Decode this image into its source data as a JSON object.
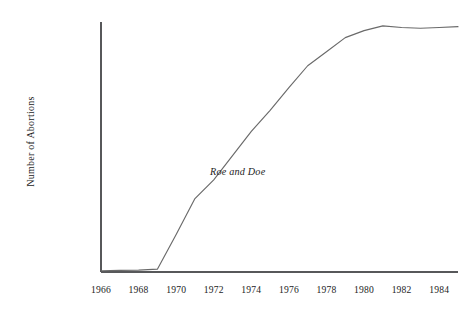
{
  "chart_data": {
    "type": "line",
    "title": "",
    "xlabel": "",
    "ylabel": "Number of Abortions",
    "xlim": [
      1966,
      1985
    ],
    "ylim": [
      0,
      1600000
    ],
    "grid": false,
    "legend": "none",
    "x_tick_labels": [
      "1966",
      "1968",
      "1970",
      "1972",
      "1974",
      "1976",
      "1978",
      "1980",
      "1982",
      "1984"
    ],
    "x_tick_values": [
      1966,
      1968,
      1970,
      1972,
      1974,
      1976,
      1978,
      1980,
      1982,
      1984
    ],
    "y_tick_labels": [
      "0",
      "200,000",
      "400,000",
      "600,000",
      "800,000",
      "1,000,000",
      "1,200,000",
      "1,400,000",
      "1,600,000"
    ],
    "y_tick_values": [
      0,
      200000,
      400000,
      600000,
      800000,
      1000000,
      1200000,
      1400000,
      1600000
    ],
    "series": [
      {
        "name": "Number of Abortions",
        "color": "#6a6a6a",
        "x": [
          1966,
          1967,
          1968,
          1969,
          1970,
          1971,
          1972,
          1973,
          1974,
          1975,
          1976,
          1977,
          1978,
          1979,
          1980,
          1981,
          1982,
          1983,
          1984,
          1985
        ],
        "values": [
          8000,
          10000,
          12000,
          18000,
          240000,
          470000,
          590000,
          745000,
          900000,
          1035000,
          1180000,
          1320000,
          1410000,
          1500000,
          1545000,
          1575000,
          1565000,
          1560000,
          1565000,
          1570000
        ]
      }
    ],
    "annotations": [
      {
        "text": "Roe and Doe",
        "style": "italic",
        "x": 1971.8,
        "y": 640000
      }
    ],
    "axis_color": "#57585a",
    "background_color": "#ffffff",
    "text_color": "#1c1c1c"
  }
}
